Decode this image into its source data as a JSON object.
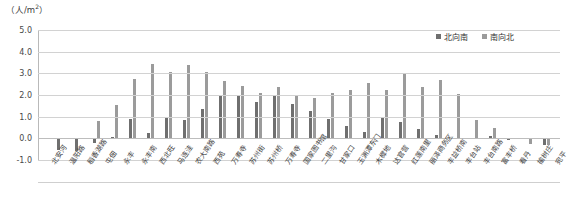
{
  "chart": {
    "unit_caption": "（人/m",
    "unit_exponent": "2",
    "unit_caption_tail": "）",
    "y_ticks": [
      "5.0",
      "4.0",
      "3.0",
      "2.0",
      "1.0",
      "0.0",
      "-1.0"
    ],
    "legend": [
      {
        "label": "北向南",
        "color": "#6f6f6f",
        "icon": "legend-square"
      },
      {
        "label": "南向北",
        "color": "#9b9b9b",
        "icon": "legend-square"
      }
    ]
  },
  "chart_data": {
    "type": "bar",
    "title": "",
    "xlabel": "",
    "ylabel": "（人/m2）",
    "ylim": [
      -1.0,
      5.0
    ],
    "grid": true,
    "legend_position": "top-right",
    "categories": [
      "北安河",
      "温阳路",
      "稻香湖路",
      "屯佃",
      "永丰",
      "永丰南",
      "西北旺",
      "马连洼",
      "农大南路",
      "西苑",
      "万寿寺",
      "苏州街",
      "苏州桥",
      "万寿寺",
      "国家图书馆",
      "二里沟",
      "甘家口",
      "玉渊潭东门",
      "木樨地",
      "达官营",
      "红莲南里",
      "丽泽商务区",
      "丰益桥南",
      "丰台站",
      "丰台南路",
      "富丰桥",
      "看丹",
      "榆树庄",
      "宛平"
    ],
    "series": [
      {
        "name": "北向南",
        "color": "#6f6f6f",
        "values": [
          -0.05,
          -0.55,
          -0.6,
          -0.2,
          0.05,
          0.9,
          0.25,
          0.95,
          0.85,
          1.35,
          1.95,
          2.0,
          1.7,
          1.95,
          1.6,
          1.25,
          0.9,
          0.55,
          0.3,
          0.95,
          0.75,
          0.45,
          0.15,
          -0.05,
          -0.05,
          0.1,
          -0.1,
          -0.05,
          -0.3
        ]
      },
      {
        "name": "南向北",
        "color": "#9b9b9b",
        "values": [
          -0.05,
          -0.05,
          -0.05,
          0.8,
          1.55,
          2.75,
          3.45,
          3.05,
          3.4,
          3.05,
          2.65,
          2.4,
          2.1,
          2.35,
          2.0,
          1.85,
          2.1,
          2.25,
          2.55,
          2.25,
          2.95,
          2.35,
          2.7,
          2.05,
          0.85,
          0.5,
          -0.05,
          -0.25,
          -0.3
        ]
      }
    ]
  }
}
